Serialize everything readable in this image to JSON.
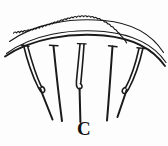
{
  "figure": {
    "label": "C",
    "panel_letter": "C",
    "caption": "C",
    "type": "line-art-illustration",
    "background_color": "#fdfdfd",
    "ink_color": "#1a1a1a",
    "label_color": "#121212"
  },
  "canvas": {
    "width": 168,
    "height": 146
  },
  "tissue": {
    "serrated_edge": {
      "name": "serrated-tissue-margin",
      "tooth_count": 34,
      "start": [
        13,
        33
      ],
      "end": [
        161,
        44
      ],
      "apex_y": 18,
      "amplitude": 2.4
    },
    "arcs": [
      {
        "name": "tissue-arc-upper",
        "start": [
          9,
          41
        ],
        "end": [
          163,
          52
        ],
        "apex_y": 25,
        "weight": 1.15
      },
      {
        "name": "tissue-arc-lower",
        "start": [
          6,
          53
        ],
        "end": [
          166,
          62
        ],
        "apex_y": 37,
        "weight": 1.15
      },
      {
        "name": "tissue-arc-base",
        "start": [
          5,
          56
        ],
        "end": [
          165,
          66
        ],
        "apex_y": 41,
        "weight": 1.9
      }
    ]
  },
  "sutures": [
    {
      "name": "suture-loop-left-outer",
      "kind": "loop",
      "top": [
        24,
        46
      ],
      "bottom": [
        40,
        92
      ],
      "tail_end": [
        52,
        118
      ]
    },
    {
      "name": "suture-line-left-inner",
      "kind": "straight",
      "top": [
        53,
        46
      ],
      "bottom": [
        62,
        121
      ]
    },
    {
      "name": "suture-hook-center",
      "kind": "hook",
      "top": [
        82,
        45
      ],
      "bottom": [
        78,
        88
      ],
      "tail_end": [
        80,
        122
      ]
    },
    {
      "name": "suture-line-right-inner",
      "kind": "straight",
      "top": [
        112,
        46
      ],
      "bottom": [
        107,
        120
      ]
    },
    {
      "name": "suture-loop-right-outer",
      "kind": "loop",
      "top": [
        142,
        48
      ],
      "bottom": [
        126,
        93
      ],
      "tail_end": [
        118,
        117
      ]
    }
  ]
}
